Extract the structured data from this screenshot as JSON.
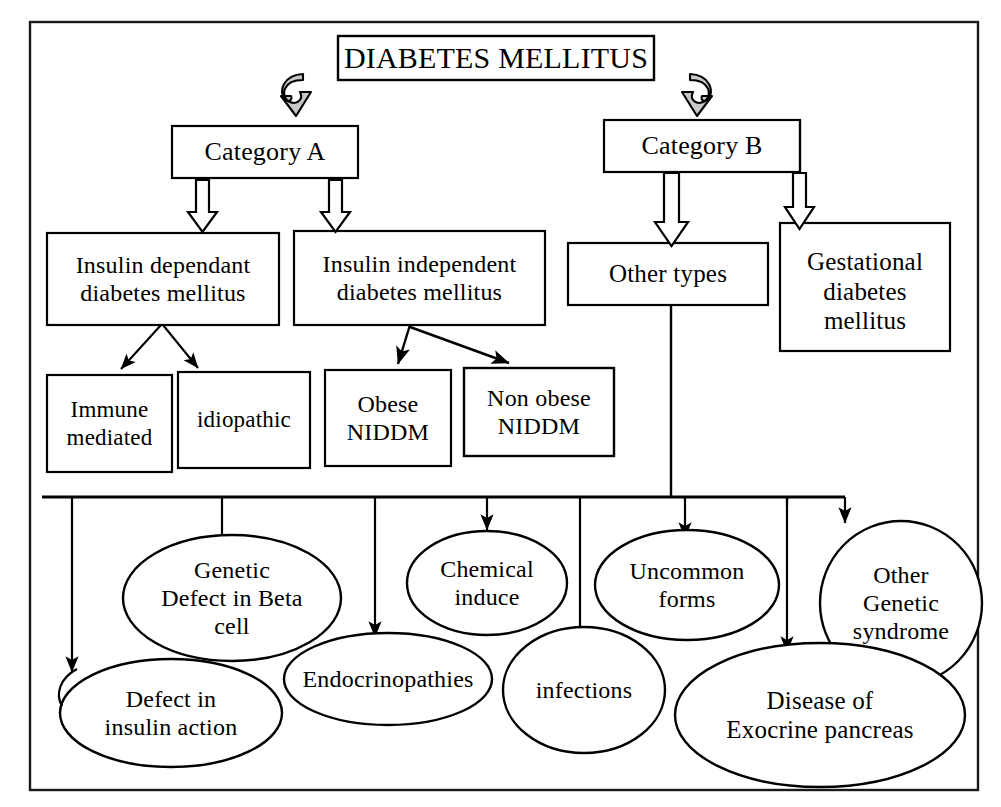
{
  "figure": {
    "kind": "classification-flowchart",
    "title": "DIABETES MELLITUS",
    "border_color": "#1a1a1a",
    "background": "#ffffff",
    "line_color": "#000000"
  },
  "nodes": {
    "root": {
      "label": "DIABETES MELLITUS",
      "shape": "rect"
    },
    "category_a": {
      "label": "Category A",
      "shape": "rect"
    },
    "category_b": {
      "label": "Category B",
      "shape": "rect"
    },
    "iddm": {
      "label": "Insulin dependant\ndiabetes mellitus",
      "shape": "rect"
    },
    "niddm": {
      "label": "Insulin independent\ndiabetes mellitus",
      "shape": "rect"
    },
    "other_types": {
      "label": "Other types",
      "shape": "rect"
    },
    "gestational": {
      "label": "Gestational\ndiabetes\nmellitus",
      "shape": "rect"
    },
    "immune_mediated": {
      "label": "Immune\nmediated",
      "shape": "rect"
    },
    "idiopathic": {
      "label": "idiopathic",
      "shape": "rect"
    },
    "obese_niddm": {
      "label": "Obese\nNIDDM",
      "shape": "rect"
    },
    "non_obese_niddm": {
      "label": "Non obese\nNIDDM",
      "shape": "rect"
    },
    "defect_insulin_action": {
      "label": "Defect in\ninsulin action",
      "shape": "ellipse"
    },
    "genetic_defect_beta_cell": {
      "label": "Genetic\nDefect in Beta\ncell",
      "shape": "ellipse"
    },
    "endocrinopathies": {
      "label": "Endocrinopathies",
      "shape": "ellipse"
    },
    "chemical_induce": {
      "label": "Chemical\ninduce",
      "shape": "ellipse"
    },
    "infections": {
      "label": "infections",
      "shape": "ellipse"
    },
    "uncommon_forms": {
      "label": "Uncommon\nforms",
      "shape": "ellipse"
    },
    "disease_exocrine_pancreas": {
      "label": "Disease of\nExocrine pancreas",
      "shape": "ellipse"
    },
    "other_genetic_syndrome": {
      "label": "Other\nGenetic\nsyndrome",
      "shape": "ellipse"
    }
  },
  "edges": [
    {
      "from": "root",
      "to": "category_a",
      "style": "curved-block-arrow"
    },
    {
      "from": "root",
      "to": "category_b",
      "style": "curved-block-arrow"
    },
    {
      "from": "category_a",
      "to": "iddm",
      "style": "block-arrow"
    },
    {
      "from": "category_a",
      "to": "niddm",
      "style": "block-arrow"
    },
    {
      "from": "category_b",
      "to": "other_types",
      "style": "block-arrow"
    },
    {
      "from": "category_b",
      "to": "gestational",
      "style": "block-arrow"
    },
    {
      "from": "iddm",
      "to": "immune_mediated",
      "style": "line-arrow"
    },
    {
      "from": "iddm",
      "to": "idiopathic",
      "style": "line-arrow"
    },
    {
      "from": "niddm",
      "to": "obese_niddm",
      "style": "line-arrow"
    },
    {
      "from": "niddm",
      "to": "non_obese_niddm",
      "style": "line-arrow"
    },
    {
      "from": "other_types",
      "to": "defect_insulin_action",
      "style": "bus-line-arrow"
    },
    {
      "from": "other_types",
      "to": "genetic_defect_beta_cell",
      "style": "bus-line-arrow"
    },
    {
      "from": "other_types",
      "to": "endocrinopathies",
      "style": "bus-line-arrow"
    },
    {
      "from": "other_types",
      "to": "chemical_induce",
      "style": "bus-line-arrow"
    },
    {
      "from": "other_types",
      "to": "infections",
      "style": "bus-line-arrow"
    },
    {
      "from": "other_types",
      "to": "uncommon_forms",
      "style": "bus-line-arrow"
    },
    {
      "from": "other_types",
      "to": "disease_exocrine_pancreas",
      "style": "bus-line-arrow"
    },
    {
      "from": "other_types",
      "to": "other_genetic_syndrome",
      "style": "bus-line-arrow"
    }
  ]
}
